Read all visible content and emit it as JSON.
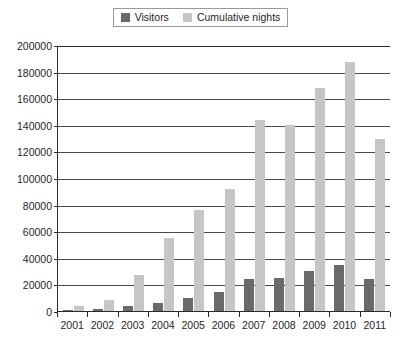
{
  "chart_data": {
    "type": "bar",
    "title": "",
    "xlabel": "",
    "ylabel": "",
    "ylim": [
      0,
      200000
    ],
    "grid": true,
    "legend_position": "top-center",
    "categories": [
      "2001",
      "2002",
      "2003",
      "2004",
      "2005",
      "2006",
      "2007",
      "2008",
      "2009",
      "2010",
      "2011"
    ],
    "y_ticks": [
      0,
      20000,
      40000,
      60000,
      80000,
      100000,
      120000,
      140000,
      160000,
      180000,
      200000
    ],
    "y_tick_labels": [
      "0",
      "20000",
      "40000",
      "60000",
      "80000",
      "100000",
      "120000",
      "140000",
      "160000",
      "180000",
      "200000"
    ],
    "series": [
      {
        "name": "Visitors",
        "color": "#6a6a6a",
        "values": [
          800,
          1800,
          4000,
          5800,
          9800,
          14500,
          24000,
          25000,
          30000,
          34500,
          24000
        ]
      },
      {
        "name": "Cumulative nights",
        "color": "#c6c6c6",
        "values": [
          4000,
          8000,
          27000,
          55000,
          76000,
          91500,
          143500,
          140000,
          167500,
          187500,
          129000
        ]
      }
    ]
  },
  "legend": {
    "entries": [
      {
        "label": "Visitors",
        "color": "#6a6a6a"
      },
      {
        "label": "Cumulative nights",
        "color": "#c6c6c6"
      }
    ]
  },
  "colors": {
    "visitors": "#6a6a6a",
    "cumulative_nights": "#c6c6c6",
    "axis": "#2b2b2b",
    "gridline": "#4a4a4a",
    "background": "#ffffff"
  }
}
